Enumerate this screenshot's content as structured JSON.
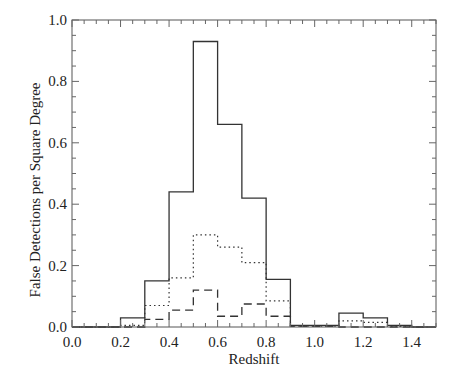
{
  "chart_data": {
    "type": "bar",
    "subtype": "step-histogram",
    "title": "",
    "xlabel": "Redshift",
    "ylabel": "False Detections per Square Degree",
    "xlim": [
      0.0,
      1.5
    ],
    "ylim": [
      0.0,
      1.0
    ],
    "grid": false,
    "legend": null,
    "x_ticks": [
      "0.0",
      "0.2",
      "0.4",
      "0.6",
      "0.8",
      "1.0",
      "1.2",
      "1.4"
    ],
    "y_ticks": [
      "0.0",
      "0.2",
      "0.4",
      "0.6",
      "0.8",
      "1.0"
    ],
    "bin_edges": [
      0.0,
      0.1,
      0.2,
      0.3,
      0.4,
      0.5,
      0.6,
      0.7,
      0.8,
      0.9,
      1.0,
      1.1,
      1.2,
      1.3,
      1.4,
      1.5
    ],
    "series": [
      {
        "name": "solid",
        "style": "solid",
        "values": [
          0.0,
          0.0,
          0.03,
          0.15,
          0.44,
          0.93,
          0.66,
          0.42,
          0.155,
          0.005,
          0.005,
          0.045,
          0.03,
          0.005,
          0.0
        ]
      },
      {
        "name": "dotted",
        "style": "dotted",
        "values": [
          0.0,
          0.0,
          0.005,
          0.07,
          0.16,
          0.3,
          0.26,
          0.21,
          0.085,
          0.003,
          0.003,
          0.02,
          0.015,
          0.002,
          0.0
        ]
      },
      {
        "name": "dashed",
        "style": "dashed",
        "values": [
          0.0,
          0.0,
          0.0,
          0.025,
          0.055,
          0.12,
          0.035,
          0.075,
          0.035,
          0.002,
          0.002,
          0.0,
          0.0,
          0.0,
          0.0
        ]
      }
    ]
  }
}
